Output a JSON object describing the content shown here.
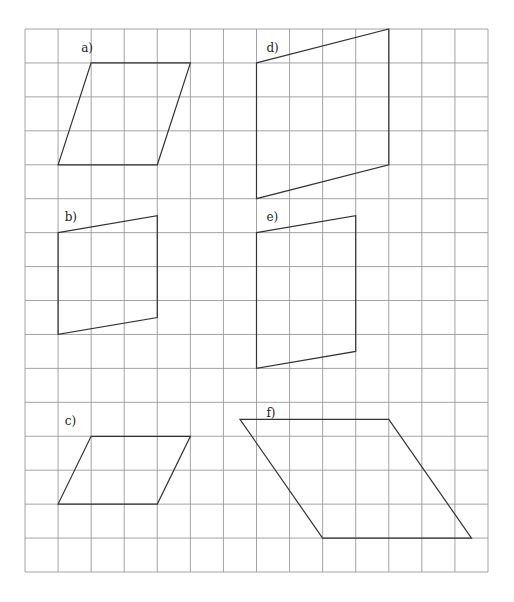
{
  "figure": {
    "grid": {
      "columns": 14,
      "rows": 16,
      "line_color": "#9a9a9a"
    },
    "shape_color": "#333333",
    "shapes": [
      {
        "id": "a",
        "label": "a)",
        "label_at": [
          1.7,
          0.55
        ],
        "vertices": [
          [
            2,
            1
          ],
          [
            5,
            1
          ],
          [
            4,
            4
          ],
          [
            1,
            4
          ]
        ]
      },
      {
        "id": "b",
        "label": "b)",
        "label_at": [
          1.2,
          5.55
        ],
        "vertices": [
          [
            1,
            6
          ],
          [
            4,
            5.5
          ],
          [
            4,
            8.5
          ],
          [
            1,
            9
          ]
        ]
      },
      {
        "id": "c",
        "label": "c)",
        "label_at": [
          1.2,
          11.55
        ],
        "vertices": [
          [
            2,
            12
          ],
          [
            5,
            12
          ],
          [
            4,
            14
          ],
          [
            1,
            14
          ]
        ]
      },
      {
        "id": "d",
        "label": "d)",
        "label_at": [
          7.3,
          0.55
        ],
        "vertices": [
          [
            7,
            1
          ],
          [
            11,
            0
          ],
          [
            11,
            4
          ],
          [
            7,
            5
          ]
        ]
      },
      {
        "id": "e",
        "label": "e)",
        "label_at": [
          7.3,
          5.55
        ],
        "vertices": [
          [
            7,
            6
          ],
          [
            10,
            5.5
          ],
          [
            10,
            9.5
          ],
          [
            7,
            10
          ]
        ]
      },
      {
        "id": "f",
        "label": "f)",
        "label_at": [
          7.3,
          11.3
        ],
        "vertices": [
          [
            6.5,
            11.5
          ],
          [
            11,
            11.5
          ],
          [
            13.5,
            15
          ],
          [
            9,
            15
          ]
        ]
      }
    ]
  }
}
